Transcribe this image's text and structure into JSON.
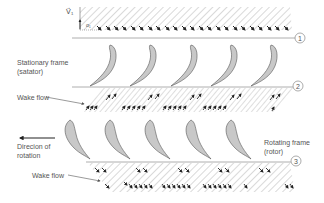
{
  "diagram": {
    "labels": {
      "stationary_frame_line1": "Stationary frame",
      "stationary_frame_line2": "(satator)",
      "wake_flow_1": "Wake flow",
      "direction_line1": "Direcion of",
      "direction_line2": "rotation",
      "rotating_frame_line1": "Rotating frame",
      "rotating_frame_line2": "(rotor)",
      "wake_flow_2": "Wake flow",
      "velocity_label": "V⃗₁",
      "alpha_label": "α₁"
    },
    "stations": [
      {
        "id": "1"
      },
      {
        "id": "2"
      },
      {
        "id": "3"
      }
    ],
    "colors": {
      "line": "#888888",
      "hatch": "#9a9a9a",
      "blade_fill": "#c8c8c8",
      "blade_stroke": "#555555",
      "arrow": "#222222",
      "text": "#555555"
    }
  }
}
